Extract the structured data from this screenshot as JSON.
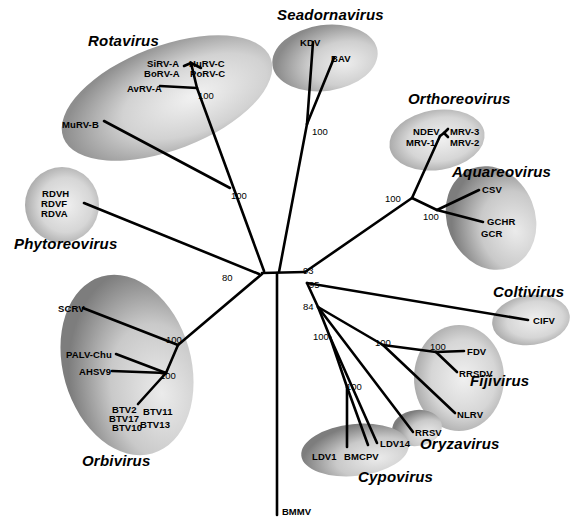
{
  "figure": {
    "type": "unrooted-phylogenetic-tree",
    "root_outgroup": "BMMV",
    "line_color": "#000000",
    "background": "#ffffff"
  },
  "genera": [
    {
      "name": "Rotavirus",
      "x": 88,
      "y": 32,
      "taxa": [
        "SiRV-A",
        "BoRV-A",
        "HuRV-C",
        "PoRV-C",
        "AvRV-A",
        "MuRV-B"
      ]
    },
    {
      "name": "Seadornavirus",
      "x": 277,
      "y": 6,
      "taxa": [
        "KDV",
        "BAV"
      ]
    },
    {
      "name": "Orthoreovirus",
      "x": 408,
      "y": 90,
      "taxa": [
        "NDEV",
        "MRV-1",
        "MRV-3",
        "MRV-2"
      ]
    },
    {
      "name": "Aquareovirus",
      "x": 452,
      "y": 163,
      "taxa": [
        "CSV",
        "GCHR",
        "GCR"
      ]
    },
    {
      "name": "Coltivirus",
      "x": 493,
      "y": 283,
      "taxa": [
        "CIFV"
      ]
    },
    {
      "name": "Fijivirus",
      "x": 470,
      "y": 372,
      "taxa": [
        "FDV",
        "RRSDV",
        "NLRV"
      ]
    },
    {
      "name": "Oryzavirus",
      "x": 420,
      "y": 435,
      "taxa": [
        "RRSV"
      ]
    },
    {
      "name": "Cypovirus",
      "x": 358,
      "y": 468,
      "taxa": [
        "LDV1",
        "BMCPV",
        "LDV14"
      ]
    },
    {
      "name": "Orbivirus",
      "x": 82,
      "y": 452,
      "taxa": [
        "SCRV",
        "PALV-Chu",
        "AHSV9",
        "BTV2",
        "BTV17",
        "BTV10",
        "BTV11",
        "BTV13"
      ]
    },
    {
      "name": "Phytoreovirus",
      "x": 14,
      "y": 235,
      "taxa": [
        "RDVH",
        "RDVF",
        "RDVA"
      ]
    }
  ],
  "taxa_labels": [
    {
      "id": "SiRV-A",
      "x": 147,
      "y": 58
    },
    {
      "id": "BoRV-A",
      "x": 144,
      "y": 68
    },
    {
      "id": "HuRV-C",
      "x": 189,
      "y": 58
    },
    {
      "id": "PoRV-C",
      "x": 190,
      "y": 68
    },
    {
      "id": "AvRV-A",
      "x": 127,
      "y": 83
    },
    {
      "id": "MuRV-B",
      "x": 62,
      "y": 119
    },
    {
      "id": "RDVH",
      "x": 42,
      "y": 188
    },
    {
      "id": "RDVF",
      "x": 41,
      "y": 198
    },
    {
      "id": "RDVA",
      "x": 41,
      "y": 208
    },
    {
      "id": "KDV",
      "x": 300,
      "y": 37
    },
    {
      "id": "BAV",
      "x": 331,
      "y": 53
    },
    {
      "id": "NDEV",
      "x": 413,
      "y": 126
    },
    {
      "id": "MRV-1",
      "x": 406,
      "y": 137
    },
    {
      "id": "MRV-3",
      "x": 446,
      "y": 126
    },
    {
      "id": "MRV-2",
      "x": 446,
      "y": 137
    },
    {
      "id": "CSV",
      "x": 472,
      "y": 188
    },
    {
      "id": "GCHR",
      "x": 487,
      "y": 216
    },
    {
      "id": "GCR",
      "x": 481,
      "y": 228
    },
    {
      "id": "CIFV",
      "x": 533,
      "y": 316
    },
    {
      "id": "FDV",
      "x": 467,
      "y": 348
    },
    {
      "id": "RRSDV",
      "x": 459,
      "y": 371
    },
    {
      "id": "NLRV",
      "x": 457,
      "y": 410
    },
    {
      "id": "RRSV",
      "x": 415,
      "y": 427
    },
    {
      "id": "LDV1",
      "x": 312,
      "y": 451
    },
    {
      "id": "BMCPV",
      "x": 344,
      "y": 451
    },
    {
      "id": "LDV14",
      "x": 380,
      "y": 438
    },
    {
      "id": "SCRV",
      "x": 58,
      "y": 303
    },
    {
      "id": "PALV-Chu",
      "x": 66,
      "y": 351
    },
    {
      "id": "AHSV9",
      "x": 79,
      "y": 368
    },
    {
      "id": "BTV2",
      "x": 112,
      "y": 404
    },
    {
      "id": "BTV17",
      "x": 109,
      "y": 414
    },
    {
      "id": "BTV10",
      "x": 112,
      "y": 423
    },
    {
      "id": "BTV11",
      "x": 143,
      "y": 406
    },
    {
      "id": "BTV13",
      "x": 140,
      "y": 419
    }
  ],
  "bootstrap_values": [
    {
      "value": "100",
      "x": 198,
      "y": 90,
      "clade": "rotavirus-inner"
    },
    {
      "value": "100",
      "x": 231,
      "y": 190,
      "clade": "rotavirus-stem"
    },
    {
      "value": "100",
      "x": 312,
      "y": 126,
      "clade": "seadornavirus"
    },
    {
      "value": "100",
      "x": 397,
      "y": 193,
      "clade": "orthoreovirus-aquareovirus"
    },
    {
      "value": "100",
      "x": 429,
      "y": 208,
      "clade": "aquareovirus"
    },
    {
      "value": "80",
      "x": 222,
      "y": 272,
      "clade": "basal-left"
    },
    {
      "value": "93",
      "x": 304,
      "y": 268,
      "clade": "central-93"
    },
    {
      "value": "95",
      "x": 308,
      "y": 280,
      "clade": "central-95"
    },
    {
      "value": "84",
      "x": 310,
      "y": 304,
      "clade": "central-84"
    },
    {
      "value": "100",
      "x": 318,
      "y": 331,
      "clade": "cypovirus-stem"
    },
    {
      "value": "100",
      "x": 349,
      "y": 383,
      "clade": "cypovirus-inner"
    },
    {
      "value": "100",
      "x": 375,
      "y": 341,
      "clade": "fijivirus-oryzavirus"
    },
    {
      "value": "100",
      "x": 430,
      "y": 347,
      "clade": "fijivirus-inner"
    },
    {
      "value": "100",
      "x": 166,
      "y": 336,
      "clade": "orbivirus-stem"
    },
    {
      "value": "100",
      "x": 160,
      "y": 372,
      "clade": "orbivirus-inner"
    }
  ],
  "root": {
    "label": "BMMV",
    "x": 277,
    "y": 512
  }
}
